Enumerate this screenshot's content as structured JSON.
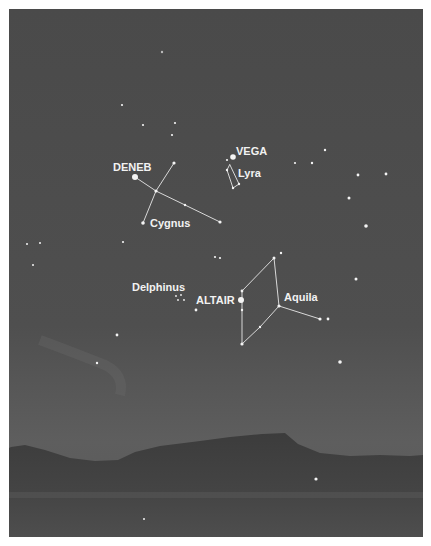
{
  "figure": {
    "colors": {
      "sky_top": "#4a4a4a",
      "sky_bottom": "#5c5c5c",
      "mountain": "#3e3e3e",
      "foreground": "#4d4d4d",
      "star": "#f4f4f4",
      "line": "#d8d8d8",
      "label": "#f2f2f2"
    }
  },
  "labels": {
    "deneb": "DENEB",
    "cygnus": "Cygnus",
    "vega": "VEGA",
    "lyra": "Lyra",
    "delphinus": "Delphinus",
    "altair": "ALTAIR",
    "aquila": "Aquila"
  },
  "constellations": [
    {
      "name": "Cygnus",
      "bright_star": "Deneb"
    },
    {
      "name": "Lyra",
      "bright_star": "Vega"
    },
    {
      "name": "Aquila",
      "bright_star": "Altair"
    },
    {
      "name": "Delphinus",
      "bright_star": null
    }
  ]
}
